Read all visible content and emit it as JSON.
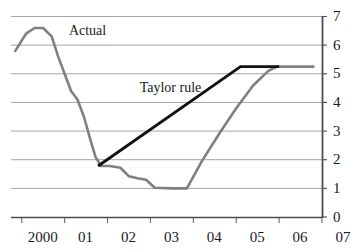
{
  "chart_data": {
    "type": "line",
    "title": "",
    "subtitle": "",
    "xlabel": "",
    "ylabel": "",
    "grid": true,
    "legend_position": "inline-annotations",
    "xlim": [
      1999.75,
      2007.0
    ],
    "ylim": [
      0,
      7
    ],
    "y_ticks": [
      "7",
      "6",
      "5",
      "4",
      "3",
      "2",
      "1",
      "0"
    ],
    "y_tick_values": [
      7,
      6,
      5,
      4,
      3,
      2,
      1,
      0
    ],
    "x_ticks": [
      "2000",
      "01",
      "02",
      "03",
      "04",
      "05",
      "06",
      "07"
    ],
    "x_tick_values": [
      2000,
      2001,
      2002,
      2003,
      2004,
      2005,
      2006,
      2007
    ],
    "annotations": [
      {
        "text": "Actual",
        "x": 2001.1,
        "y": 6.6
      },
      {
        "text": "Taylor rule",
        "x": 2002.75,
        "y": 4.6
      }
    ],
    "series": [
      {
        "name": "Actual",
        "color": "#808080",
        "x": [
          1999.85,
          2000.1,
          2000.3,
          2000.5,
          2000.7,
          2000.85,
          2001.0,
          2001.15,
          2001.3,
          2001.45,
          2001.6,
          2001.72,
          2001.85,
          2002.05,
          2002.3,
          2002.5,
          2002.7,
          2002.9,
          2003.1,
          2003.5,
          2003.85,
          2004.2,
          2004.6,
          2005.0,
          2005.4,
          2005.75,
          2005.95,
          2006.3,
          2006.8
        ],
        "y": [
          5.8,
          6.4,
          6.6,
          6.6,
          6.3,
          5.6,
          5.0,
          4.4,
          4.1,
          3.5,
          2.7,
          2.1,
          1.78,
          1.78,
          1.72,
          1.42,
          1.35,
          1.3,
          1.02,
          1.0,
          1.0,
          1.95,
          2.9,
          3.8,
          4.6,
          5.1,
          5.25,
          5.25,
          5.25
        ]
      },
      {
        "name": "Taylor rule",
        "color": "#111111",
        "x": [
          2001.78,
          2005.1,
          2006.0
        ],
        "y": [
          1.78,
          5.25,
          5.25
        ]
      }
    ]
  },
  "axis": {
    "y_axis_side": "right",
    "x_axis_side": "bottom"
  },
  "labels": {
    "actual": "Actual",
    "taylor_rule": "Taylor rule"
  }
}
